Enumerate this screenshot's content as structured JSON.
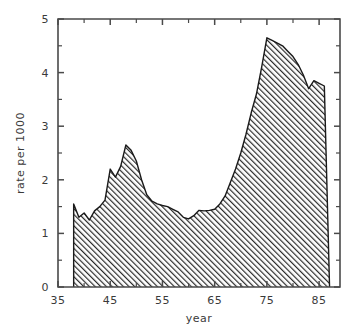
{
  "chart_data": {
    "type": "area",
    "title": "",
    "subtitle": "",
    "xlabel": "year",
    "ylabel": "rate per 1000",
    "xlim": [
      35,
      89
    ],
    "ylim": [
      0,
      5
    ],
    "grid": false,
    "legend": null,
    "x_ticks_major": [
      35,
      45,
      55,
      65,
      75,
      85
    ],
    "x_ticks_major_labels": [
      "35",
      "45",
      "55",
      "65",
      "75",
      "85"
    ],
    "x_ticks_minor": [
      40,
      50,
      60,
      70,
      80
    ],
    "y_ticks_major": [
      0,
      1,
      2,
      3,
      4,
      5
    ],
    "y_ticks_major_labels": [
      "0",
      "1",
      "2",
      "3",
      "4",
      "5"
    ],
    "y_ticks_minor": [
      0.5,
      1.5,
      2.5,
      3.5,
      4.5
    ],
    "fill_pattern": "diagonal-hatch",
    "fill_color": "#4d4d4d",
    "line_color": "#1a1a1a",
    "background_color": "#ffffff",
    "axis_color": "#4a4a4a",
    "x": [
      38,
      39,
      40,
      41,
      42,
      43,
      44,
      45,
      46,
      47,
      48,
      49,
      50,
      51,
      52,
      53,
      54,
      55,
      56,
      57,
      58,
      59,
      60,
      61,
      62,
      63,
      64,
      65,
      66,
      67,
      68,
      69,
      70,
      71,
      72,
      73,
      74,
      75,
      76,
      77,
      78,
      79,
      80,
      81,
      82,
      83,
      84,
      85,
      86,
      87
    ],
    "values": [
      1.55,
      1.3,
      1.38,
      1.25,
      1.42,
      1.5,
      1.62,
      2.2,
      2.05,
      2.25,
      2.65,
      2.55,
      2.35,
      2.0,
      1.72,
      1.6,
      1.55,
      1.52,
      1.5,
      1.45,
      1.4,
      1.3,
      1.27,
      1.33,
      1.43,
      1.42,
      1.43,
      1.45,
      1.55,
      1.7,
      1.95,
      2.2,
      2.5,
      2.85,
      3.25,
      3.6,
      4.1,
      4.65,
      4.6,
      4.55,
      4.5,
      4.4,
      4.3,
      4.15,
      3.95,
      3.7,
      3.85,
      3.8,
      3.75,
      0.0
    ],
    "series": [
      {
        "name": "rate per 1000",
        "values": [
          1.55,
          1.3,
          1.38,
          1.25,
          1.42,
          1.5,
          1.62,
          2.2,
          2.05,
          2.25,
          2.65,
          2.55,
          2.35,
          2.0,
          1.72,
          1.6,
          1.55,
          1.52,
          1.5,
          1.45,
          1.4,
          1.3,
          1.27,
          1.33,
          1.43,
          1.42,
          1.43,
          1.45,
          1.55,
          1.7,
          1.95,
          2.2,
          2.5,
          2.85,
          3.25,
          3.6,
          4.1,
          4.65,
          4.6,
          4.55,
          4.5,
          4.4,
          4.3,
          4.15,
          3.95,
          3.7,
          3.85,
          3.8,
          3.75,
          0.0
        ]
      }
    ],
    "annotations": []
  }
}
